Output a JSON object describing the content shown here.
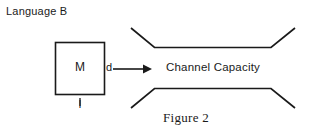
{
  "figure": {
    "title": "Language B",
    "caption": "Figure 2",
    "box": {
      "symbol": "M",
      "width_label": "l"
    },
    "arrow": {
      "label": "d",
      "icon": "right-arrow-icon"
    },
    "channel": {
      "label": "Channel Capacity",
      "shape": "horn-funnel"
    },
    "colors": {
      "ink": "#1a1a1a",
      "background": "#ffffff"
    }
  }
}
